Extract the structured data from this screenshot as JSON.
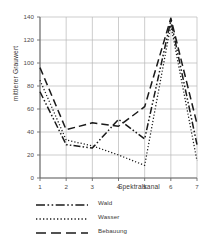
{
  "chart_data": {
    "type": "line",
    "title": "",
    "xlabel": "Spektralkanal",
    "ylabel": "mittlerer Grauwert",
    "x": [
      1,
      2,
      3,
      4,
      5,
      6,
      7
    ],
    "xticklabels": [
      "1",
      "2",
      "3",
      "4",
      "5",
      "6",
      "7"
    ],
    "yticklabels": [
      "0",
      "20",
      "40",
      "60",
      "80",
      "100",
      "120",
      "140"
    ],
    "yticks": [
      0,
      20,
      40,
      60,
      80,
      100,
      120,
      140
    ],
    "xlim": [
      1,
      7
    ],
    "ylim": [
      0,
      140
    ],
    "grid": true,
    "legend_position": "below",
    "series": [
      {
        "name": "Wald",
        "style": "dash-dot-dot",
        "color": "#1a1a1a",
        "values": [
          75,
          29,
          26,
          51,
          34,
          137,
          29
        ]
      },
      {
        "name": "Wasser",
        "style": "dotted",
        "color": "#1a1a1a",
        "values": [
          85,
          33,
          28,
          20,
          11,
          133,
          15
        ]
      },
      {
        "name": "Bebauung",
        "style": "dashed",
        "color": "#1a1a1a",
        "values": [
          96,
          42,
          48,
          45,
          62,
          139,
          47
        ]
      }
    ]
  },
  "axes": {
    "y_title": "mittlerer Grauwert",
    "x_title": "Spektralkanal",
    "y_ticks": [
      "140",
      "120",
      "100",
      "80",
      "60",
      "40",
      "20",
      "0"
    ],
    "x_ticks": [
      "1",
      "2",
      "3",
      "4",
      "5",
      "6",
      "7"
    ]
  },
  "legend": {
    "items": [
      {
        "label": "Wald"
      },
      {
        "label": "Wasser"
      },
      {
        "label": "Bebauung"
      }
    ]
  },
  "colors": {
    "line": "#1a1a1a",
    "grid": "#b8b8b8",
    "axis": "#6b6b6b",
    "text": "#3b3836"
  }
}
